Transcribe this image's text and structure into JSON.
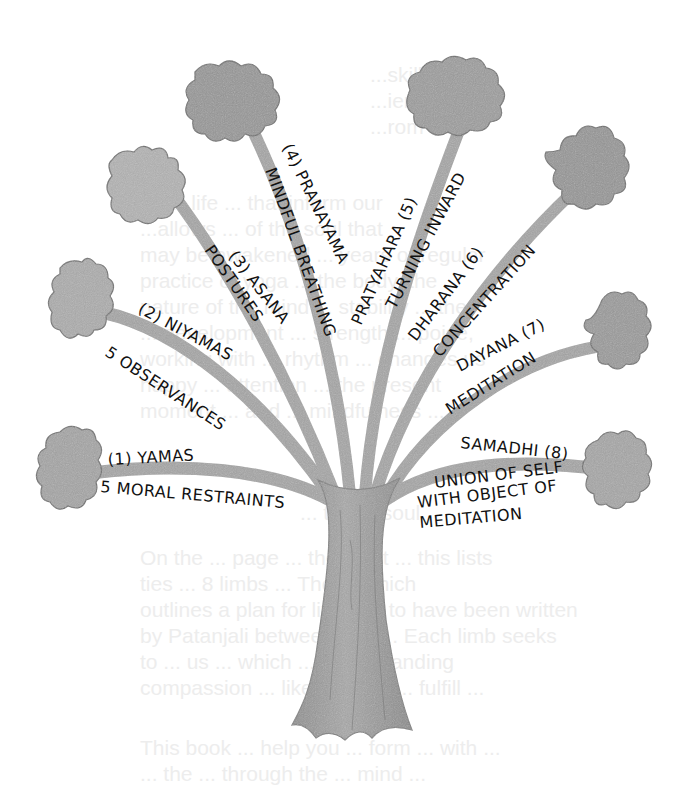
{
  "figure": {
    "style": "pencil illustration",
    "colors": {
      "background": "#ffffff",
      "branch": "#a9a9a9",
      "branch_dark": "#8c8c8c",
      "trunk": "#9a9a9a",
      "flower": "#8f8f8f",
      "flower_light": "#bdbdbd",
      "text": "#111111",
      "ghost_text": "#ededed"
    },
    "limbs": [
      {
        "number": "(1)",
        "name": "YAMAS",
        "line1": "(1) YAMAS",
        "line2": "5 MORAL RESTRAINTS"
      },
      {
        "number": "(2)",
        "name": "NIYAMAS",
        "line1": "(2) NIYAMAS",
        "line2": "5 OBSERVANCES"
      },
      {
        "number": "(3)",
        "name": "ASANA",
        "line1": "(3) ASANA",
        "line2": "POSTURES"
      },
      {
        "number": "(4)",
        "name": "PRANAYAMA",
        "line1": "(4) PRANAYAMA",
        "line2": "MINDFUL BREATHING"
      },
      {
        "number": "(5)",
        "name": "PRATYAHARA",
        "line1": "PRATYAHARA (5)",
        "line2": "TURNING INWARD"
      },
      {
        "number": "(6)",
        "name": "DHARANA",
        "line1": "DHARANA (6)",
        "line2": "CONCENTRATION"
      },
      {
        "number": "(7)",
        "name": "DAYANA",
        "line1": "DAYANA (7)",
        "line2": "MEDITATION"
      },
      {
        "number": "(8)",
        "name": "SAMADHI",
        "line1": "SAMADHI (8)",
        "line2": "UNION OF SELF",
        "line3": "WITH OBJECT OF",
        "line4": "MEDITATION"
      }
    ]
  },
  "ghost_text": {
    "lines": [
      "                         ...skills that",
      "                         ...ience, and",
      "                         ...rom all",
      "",
      "...nal life ... that inform our",
      "...allows ... of the soul that",
      "may be awakened ... years of regular",
      "practice of yoga ... the body, the",
      "nature of the mind ... stability ... the",
      "... development ... strength ... poise,",
      "working with ... rhythm ... changes us",
      "happy ... attention ... the present",
      "moment ... and ... mindfulness ...",
      "... the ... soul",
      "",
      "On the ... page ... the eight ... this lists",
      "ties ... 8 limbs ... The ... which",
      "outlines a plan for living ... to have been written",
      "by Patanjali between 500 ... Each limb seeks",
      "to ... us ... which ... understanding",
      "compassion ... like the tree ... fulfill ...",
      "",
      "This book ... help you ... form ... with ...",
      "... the ... through the ... mind ..."
    ]
  }
}
